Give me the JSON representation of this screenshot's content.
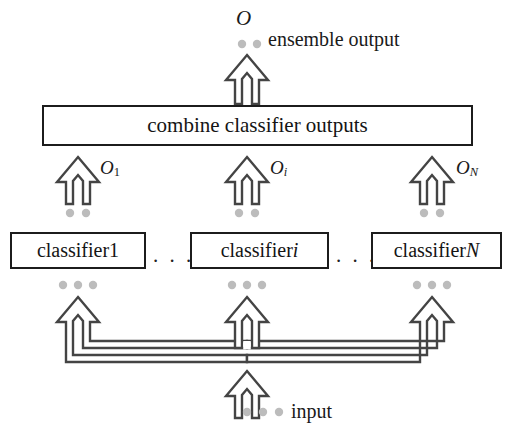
{
  "figure": {
    "type": "diagram",
    "line_color": "#3a3a3a",
    "box_border_color": "#1c1c1c",
    "text_color": "#141414",
    "dot_color": "#b9b9b9",
    "background": "#ffffff"
  },
  "top": {
    "output_symbol": "O",
    "output_text": "ensemble output",
    "arrow_name": "ensemble-output-arrow",
    "dots": 2
  },
  "combine": {
    "label": "combine classifier outputs"
  },
  "outputs": [
    {
      "symbol": "O",
      "subscript": "1",
      "subscript_italic": false,
      "name": "o1"
    },
    {
      "symbol": "O",
      "subscript": "i",
      "subscript_italic": true,
      "name": "oi"
    },
    {
      "symbol": "O",
      "subscript": "N",
      "subscript_italic": true,
      "name": "on"
    }
  ],
  "classifiers": [
    {
      "prefix": "classifier ",
      "index": "1",
      "index_italic": false,
      "name": "classifier-1"
    },
    {
      "prefix": "classifier ",
      "index": "i",
      "index_italic": true,
      "name": "classifier-i"
    },
    {
      "prefix": "classifier ",
      "index": "N",
      "index_italic": true,
      "name": "classifier-n"
    }
  ],
  "ellipses": {
    "left": ". . .",
    "right": ". . ."
  },
  "bottom": {
    "input_text": "input",
    "arrow_name": "input-arrow",
    "dots": 3,
    "fanout_arrows": 3
  },
  "dot_groups": {
    "under_outputs": 2,
    "under_classifiers": 3,
    "under_input": 3
  }
}
